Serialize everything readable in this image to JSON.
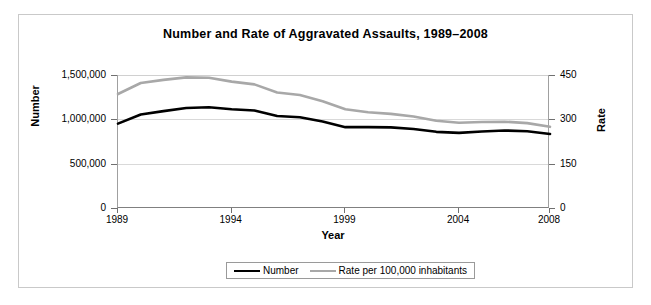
{
  "chart_data": {
    "type": "line",
    "title": "Number and Rate of Aggravated Assaults, 1989–2008",
    "xlabel": "Year",
    "ylabel": "Number",
    "y2label": "Rate",
    "grid": true,
    "legend_position": "bottom",
    "xlim": [
      1989,
      2008
    ],
    "ylim": [
      0,
      1500000
    ],
    "y2lim": [
      0,
      450
    ],
    "x": [
      1989,
      1990,
      1991,
      1992,
      1993,
      1994,
      1995,
      1996,
      1997,
      1998,
      1999,
      2000,
      2001,
      2002,
      2003,
      2004,
      2005,
      2006,
      2007,
      2008
    ],
    "xticks": [
      1989,
      1994,
      1999,
      2004,
      2008
    ],
    "xticklabels": [
      "1989",
      "1994",
      "1999",
      "2004",
      "2008"
    ],
    "yticks": [
      0,
      500000,
      1000000,
      1500000
    ],
    "yticklabels": [
      "0",
      "500,000",
      "1,000,000",
      "1,500,000"
    ],
    "y2ticks": [
      0,
      150,
      300,
      450
    ],
    "y2ticklabels": [
      "0",
      "150",
      "300",
      "450"
    ],
    "series": [
      {
        "name": "Number",
        "axis": "left",
        "color": "#000000",
        "width": 2.6,
        "values": [
          951707,
          1054863,
          1092739,
          1126974,
          1135607,
          1113179,
          1099207,
          1037049,
          1023201,
          976583,
          911740,
          911706,
          909023,
          891407,
          859030,
          847381,
          862220,
          874096,
          866358,
          834885
        ]
      },
      {
        "name": "Rate per 100,000 inhabitants",
        "axis": "right",
        "color": "#a8a8a8",
        "width": 2.6,
        "values": [
          385.6,
          422.9,
          433.4,
          441.9,
          440.5,
          427.6,
          418.3,
          391.0,
          382.1,
          361.4,
          334.3,
          324.0,
          318.6,
          309.5,
          295.4,
          288.6,
          291.1,
          292.0,
          287.2,
          274.6
        ]
      }
    ]
  },
  "axis_titles": {
    "left": "Number",
    "right": "Rate",
    "bottom": "Year"
  },
  "legend": {
    "items": [
      {
        "label": "Number",
        "swatch": "number"
      },
      {
        "label": "Rate per 100,000 inhabitants",
        "swatch": "rate"
      }
    ]
  }
}
